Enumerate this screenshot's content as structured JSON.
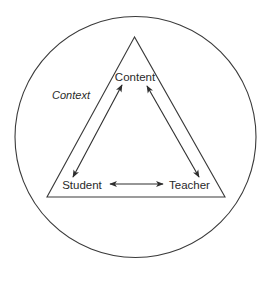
{
  "diagram": {
    "type": "didactic-triangle",
    "context_label": "Context",
    "nodes": {
      "top": "Content",
      "bottom_left": "Student",
      "bottom_right": "Teacher"
    },
    "relations": [
      {
        "from": "Content",
        "to": "Student",
        "direction": "bidirectional"
      },
      {
        "from": "Content",
        "to": "Teacher",
        "direction": "bidirectional"
      },
      {
        "from": "Student",
        "to": "Teacher",
        "direction": "bidirectional"
      }
    ],
    "colors": {
      "stroke": "#3a3a3a",
      "text": "#2a2a2a",
      "background": "#ffffff"
    }
  }
}
